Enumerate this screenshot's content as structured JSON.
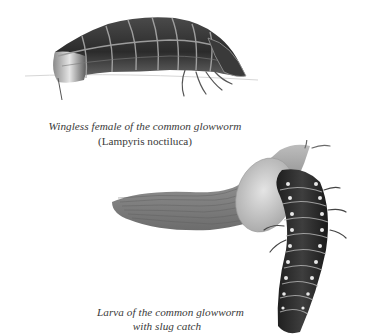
{
  "figures": [
    {
      "id": "female",
      "subject": "wingless female glowworm",
      "caption": {
        "line1": "Wingless female of the common glowworm",
        "line2": "(Lampyris noctiluca)"
      }
    },
    {
      "id": "larva",
      "subject": "glowworm larva with slug",
      "caption": {
        "line1": "Larva of the common glowworm",
        "line2": "with slug catch"
      }
    }
  ],
  "colors": {
    "background": "#ffffff",
    "caption_text": "#3a3a3a",
    "body_dark": "#2e2e2e",
    "segment_edge": "#a9a9a9",
    "slug_body": "#8f8f8f",
    "slug_mantle": "#c9c9c9",
    "larva_spot": "#e8e8e8"
  }
}
